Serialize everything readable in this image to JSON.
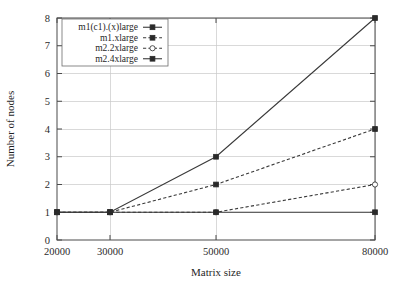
{
  "chart_data": {
    "type": "line",
    "title": "",
    "xlabel": "Matrix size",
    "ylabel": "Number of nodes",
    "x": [
      20000,
      30000,
      50000,
      80000
    ],
    "xtick_labels": [
      "20000",
      "30000",
      "50000",
      "80000"
    ],
    "ytick_labels": [
      "0",
      "1",
      "2",
      "3",
      "4",
      "5",
      "6",
      "7",
      "8"
    ],
    "xlim": [
      20000,
      80000
    ],
    "ylim": [
      0,
      8
    ],
    "grid": true,
    "legend_position": "top-left",
    "series": [
      {
        "name": "m1(c1).(x)large",
        "values": [
          1,
          1,
          3,
          8
        ],
        "style": "solid",
        "marker": "square",
        "marker_fill": "solid"
      },
      {
        "name": "m1.xlarge",
        "values": [
          1,
          1,
          2,
          4
        ],
        "style": "dashed",
        "marker": "square",
        "marker_fill": "solid"
      },
      {
        "name": "m2.2xlarge",
        "values": [
          1,
          1,
          1,
          2
        ],
        "style": "dashed",
        "marker": "circle",
        "marker_fill": "hollow"
      },
      {
        "name": "m2.4xlarge",
        "values": [
          1,
          1,
          1,
          1
        ],
        "style": "solid",
        "marker": "square",
        "marker_fill": "solid"
      }
    ],
    "colors": {
      "line": "#3a3a3a",
      "grid": "#c9c9c9",
      "axis": "#4a4a4a",
      "text": "#1f1f1f",
      "background": "#ffffff"
    }
  }
}
